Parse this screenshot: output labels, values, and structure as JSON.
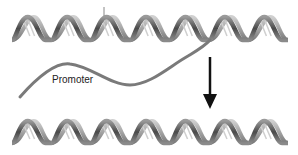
{
  "diagram": {
    "labels": {
      "promoter": "Promoter"
    },
    "elements": [
      {
        "name": "top-dna-helix",
        "type": "double-helix",
        "periods": 7
      },
      {
        "name": "promoter-strand",
        "type": "curve",
        "label": "Promoter"
      },
      {
        "name": "down-arrow",
        "type": "arrow",
        "direction": "down"
      },
      {
        "name": "bottom-dna-helix",
        "type": "double-helix",
        "periods": 7
      }
    ],
    "colors": {
      "helix_dark": "#555555",
      "helix_light": "#bbbbbb",
      "strand": "#777777",
      "arrow": "#111111"
    }
  }
}
